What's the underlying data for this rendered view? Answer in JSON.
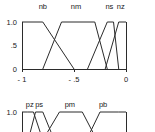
{
  "figure": {
    "background": "#ffffff",
    "line_color": "#2b2b2b",
    "text_color": "#1a1a1a"
  },
  "chart_data": [
    {
      "id": "negative-membership-functions",
      "type": "line",
      "title": "",
      "xlabel": "",
      "ylabel": "",
      "xlim": [
        -1,
        0
      ],
      "ylim": [
        0,
        1
      ],
      "grid": false,
      "legend_position": "above-curves",
      "xticks": [
        -1,
        -0.5,
        0
      ],
      "xticklabels": [
        "- 1",
        "- .5",
        "0"
      ],
      "yticks": [
        0,
        0.5,
        1.0
      ],
      "yticklabels": [
        "0",
        ".5",
        "1.0"
      ],
      "series": [
        {
          "name": "nb",
          "label": "nb",
          "label_x": -0.8,
          "shape": "trapezoid",
          "x": [
            -1.0,
            -0.8,
            -0.5
          ],
          "y": [
            1.0,
            1.0,
            0.0
          ]
        },
        {
          "name": "nm",
          "label": "nm",
          "label_x": -0.48,
          "shape": "trapezoid",
          "x": [
            -0.8,
            -0.62,
            -0.3,
            -0.18
          ],
          "y": [
            0.0,
            1.0,
            1.0,
            0.0
          ]
        },
        {
          "name": "ns",
          "label": "ns",
          "label_x": -0.16,
          "shape": "trapezoid",
          "x": [
            -0.37,
            -0.18,
            -0.12,
            -0.07
          ],
          "y": [
            0.0,
            1.0,
            1.0,
            0.0
          ]
        },
        {
          "name": "nz",
          "label": "nz",
          "label_x": -0.05,
          "shape": "trapezoid",
          "x": [
            -0.2,
            -0.07,
            0.0
          ],
          "y": [
            0.0,
            1.0,
            1.0
          ]
        }
      ]
    },
    {
      "id": "positive-membership-functions",
      "type": "line",
      "title": "",
      "xlabel": "",
      "ylabel": "",
      "xlim": [
        0,
        1
      ],
      "ylim": [
        0,
        1
      ],
      "grid": false,
      "legend_position": "above-curves",
      "xticks": [],
      "xticklabels": [],
      "yticks": [
        1.0
      ],
      "yticklabels": [
        "1.0"
      ],
      "clipped": true,
      "series": [
        {
          "name": "pz",
          "label": "pz",
          "label_x": 0.075,
          "shape": "trapezoid",
          "x": [
            0.0,
            0.05,
            0.11,
            0.2
          ],
          "y": [
            1.0,
            1.0,
            1.0,
            0.0
          ]
        },
        {
          "name": "ps",
          "label": "ps",
          "label_x": 0.165,
          "shape": "trapezoid",
          "x": [
            0.06,
            0.13,
            0.2,
            0.31
          ],
          "y": [
            0.0,
            1.0,
            1.0,
            0.0
          ]
        },
        {
          "name": "pm",
          "label": "pm",
          "label_x": 0.46,
          "shape": "trapezoid",
          "x": [
            0.2,
            0.36,
            0.58,
            0.72
          ],
          "y": [
            0.0,
            1.0,
            1.0,
            0.0
          ]
        },
        {
          "name": "pb",
          "label": "pb",
          "label_x": 0.78,
          "shape": "trapezoid",
          "x": [
            0.62,
            0.75,
            0.93,
            1.0
          ],
          "y": [
            0.0,
            1.0,
            1.0,
            1.0
          ]
        }
      ]
    }
  ]
}
